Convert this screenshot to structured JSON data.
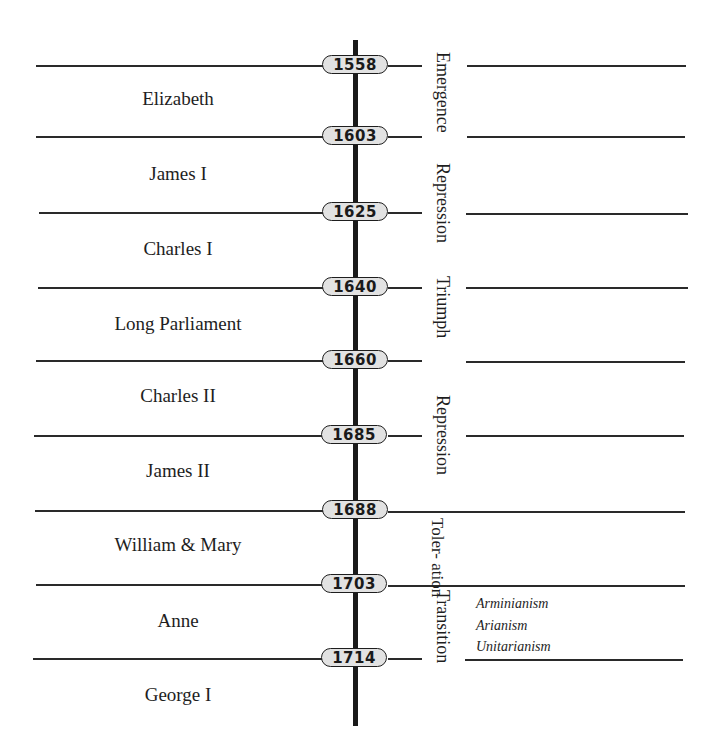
{
  "diagram": {
    "type": "timeline",
    "title": "",
    "years": [
      "1558",
      "1603",
      "1625",
      "1640",
      "1660",
      "1685",
      "1688",
      "1703",
      "1714"
    ],
    "reigns": [
      {
        "name": "Elizabeth",
        "from": "1558",
        "to": "1603"
      },
      {
        "name": "James I",
        "from": "1603",
        "to": "1625"
      },
      {
        "name": "Charles I",
        "from": "1625",
        "to": "1640"
      },
      {
        "name": "Long Parliament",
        "from": "1640",
        "to": "1660"
      },
      {
        "name": "Charles II",
        "from": "1660",
        "to": "1685"
      },
      {
        "name": "James II",
        "from": "1685",
        "to": "1688"
      },
      {
        "name": "William & Mary",
        "from": "1688",
        "to": "1703"
      },
      {
        "name": "Anne",
        "from": "1703",
        "to": "1714"
      },
      {
        "name": "George I",
        "from": "1714",
        "to": ""
      }
    ],
    "phases": [
      {
        "name": "Emergence",
        "from": "1558",
        "to": "1603"
      },
      {
        "name": "Repression",
        "from": "1603",
        "to": "1640"
      },
      {
        "name": "Triumph",
        "from": "1640",
        "to": "1660"
      },
      {
        "name": "Repression",
        "from": "1660",
        "to": "1688"
      },
      {
        "name": "Toler-",
        "name_line2": "ation",
        "from": "1688",
        "to": "1703"
      },
      {
        "name": "Transition",
        "from": "1703",
        "to": "1714+"
      }
    ],
    "transition_notes": [
      "Arminianism",
      "Arianism",
      "Unitarianism"
    ]
  }
}
